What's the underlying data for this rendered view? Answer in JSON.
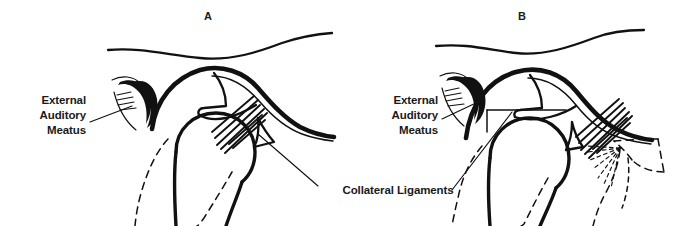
{
  "figure": {
    "background_color": "#ffffff",
    "ink_color": "#111111",
    "width": 687,
    "height": 226
  },
  "panels": [
    {
      "id": "panel-a",
      "letter": "A",
      "letter_x": 208,
      "letter_y": 20,
      "description": "Normal temporomandibular joint with disc in position"
    },
    {
      "id": "panel-b",
      "letter": "B",
      "letter_x": 522,
      "letter_y": 20,
      "description": "Temporomandibular joint with anteriorly displaced disc shown dashed"
    }
  ],
  "annotations": [
    {
      "id": "eam-left",
      "lines": [
        "External",
        "Auditory",
        "Meatus"
      ],
      "align": "end",
      "x": 86,
      "y": 104,
      "line_height": 15
    },
    {
      "id": "eam-right",
      "lines": [
        "External",
        "Auditory",
        "Meatus"
      ],
      "align": "end",
      "x": 438,
      "y": 104,
      "line_height": 15
    },
    {
      "id": "collateral-ligaments",
      "lines": [
        "Collateral Ligaments"
      ],
      "align": "middle",
      "x": 398,
      "y": 194,
      "line_height": 15
    }
  ],
  "labels": {
    "eam_line1": "External",
    "eam_line2": "Auditory",
    "eam_line3": "Meatus",
    "collateral": "Collateral Ligaments",
    "letter_a": "A",
    "letter_b": "B"
  }
}
